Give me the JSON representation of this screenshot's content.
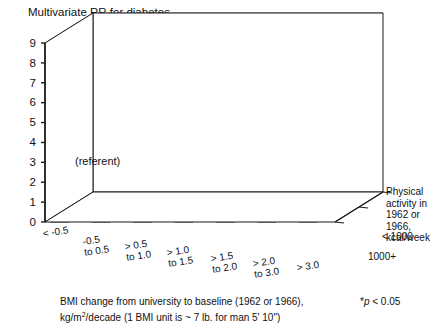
{
  "chart_title": "Multivariate RR for diabetes",
  "axis": {
    "y_ticks": [
      "0",
      "1",
      "2",
      "3",
      "4",
      "5",
      "6",
      "7",
      "8",
      "9"
    ],
    "y_min": 0,
    "y_max": 9
  },
  "x_categories": [
    {
      "l1": "< -0.5",
      "l2": ""
    },
    {
      "l1": "-0.5",
      "l2": "to 0.5"
    },
    {
      "l1": "> 0.5",
      "l2": "to 1.0"
    },
    {
      "l1": "> 1.0",
      "l2": "to 1.5"
    },
    {
      "l1": "> 1.5",
      "l2": "to 2.0"
    },
    {
      "l1": "> 2.0",
      "l2": "to 3.0"
    },
    {
      "l1": "> 3.0",
      "l2": ""
    }
  ],
  "depth_categories": [
    "< 1000",
    "1000+"
  ],
  "legend": {
    "line1": "Physical",
    "line2": "activity in",
    "line3": "1962 or 1966,",
    "line4": "kcal/week"
  },
  "annotations": {
    "referent": "(referent)",
    "significance_marker": "*"
  },
  "caption": {
    "line1_a": "BMI change from university to baseline (1962 or 1966),",
    "line2_a": "kg/m",
    "line2_sup": "2",
    "line2_b": "/decade (1 BMI unit is ~ 7 lb. for man 5' 10\")",
    "pvalue_star": "*",
    "pvalue_italic": "p",
    "pvalue_rest": " < 0.05"
  },
  "colors": {
    "bar_gray_top": "#8f8f8f",
    "bar_gray_front": "#b8b8b8",
    "bar_gray_side": "#6f6f6f",
    "bar_white_front": "#ffffff",
    "axis": "#1a1a1a",
    "grid": "#555555"
  },
  "chart_data": {
    "type": "bar",
    "title": "Multivariate RR for diabetes",
    "xlabel": "BMI change from university to baseline (1962 or 1966), kg/m2/decade",
    "ylabel": "Multivariate RR for diabetes",
    "ylim": [
      0,
      9
    ],
    "grid": true,
    "legend_position": "right",
    "legend_title": "Physical activity in 1962 or 1966, kcal/week",
    "categories": [
      "< -0.5",
      "-0.5 to 0.5",
      "> 0.5 to 1.0",
      "> 1.0 to 1.5",
      "> 1.5 to 2.0",
      "> 2.0 to 3.0",
      "> 3.0"
    ],
    "series": [
      {
        "name": "< 1000",
        "values": [
          1.6,
          1.5,
          1.6,
          2.7,
          2.9,
          4.7,
          7.1
        ],
        "significant": [
          false,
          false,
          true,
          true,
          true,
          true,
          true
        ],
        "referent": [
          false,
          false,
          false,
          false,
          false,
          false,
          false
        ]
      },
      {
        "name": "1000+",
        "values": [
          0.8,
          1.0,
          0.9,
          1.0,
          1.8,
          3.9,
          7.1
        ],
        "significant": [
          false,
          false,
          true,
          true,
          true,
          true,
          true
        ],
        "referent": [
          false,
          true,
          false,
          false,
          false,
          false,
          false
        ]
      }
    ]
  }
}
